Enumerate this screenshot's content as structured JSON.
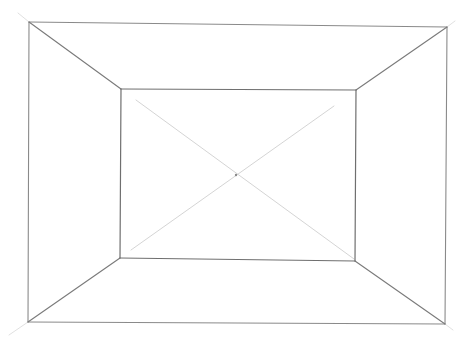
{
  "drawing": {
    "subject": "one-point perspective room sketch",
    "background": "#ffffff",
    "colors": {
      "outer": "#8a8a8a",
      "inner": "#6f6f6f",
      "receding": "#7a7a7a",
      "guide": "#cfcfcf",
      "guide_ext": "#dddddd"
    },
    "outer_frame": {
      "top": [
        29,
        22,
        447,
        27
      ],
      "right": [
        447,
        27,
        445,
        324
      ],
      "bottom": [
        445,
        324,
        28,
        322
      ],
      "left": [
        28,
        322,
        29,
        22
      ]
    },
    "back_wall": {
      "top": [
        121,
        89,
        356,
        90
      ],
      "right": [
        356,
        90,
        355,
        261
      ],
      "bottom": [
        355,
        261,
        120,
        258
      ],
      "left": [
        120,
        258,
        121,
        89
      ]
    },
    "receding_edges": {
      "top_left": [
        29,
        22,
        121,
        89
      ],
      "top_right": [
        447,
        27,
        356,
        90
      ],
      "bottom_left": [
        28,
        322,
        120,
        258
      ],
      "bottom_right": [
        445,
        324,
        355,
        261
      ]
    },
    "guide_diagonals": {
      "tl_to_br": [
        136,
        100,
        354,
        259
      ],
      "tr_to_bl": [
        334,
        106,
        131,
        250
      ]
    },
    "corner_extensions": {
      "top_left": [
        18,
        13,
        29,
        22
      ],
      "top_right": [
        447,
        27,
        455,
        21
      ],
      "bottom_left": [
        28,
        322,
        9,
        335
      ],
      "bottom_right": [
        445,
        324,
        453,
        330
      ]
    },
    "vanishing_point": {
      "x": 236,
      "y": 175,
      "r": 1.2
    }
  }
}
